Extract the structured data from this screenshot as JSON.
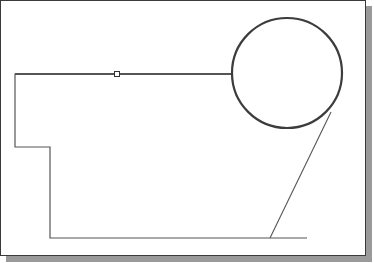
{
  "canvas": {
    "width": 374,
    "height": 263,
    "background": "#ffffff",
    "frame_border_color": "#3a3a3a",
    "shadow_color": "#9a9a9a"
  },
  "sketch": {
    "stroke_color": "#555555",
    "circle_stroke_color": "#3c3c3c",
    "circle": {
      "cx": 287,
      "cy": 73,
      "r": 55
    },
    "polyline_outline": "232,74 15,74 15,147 50,147 50,238 307,238",
    "tangent_line": {
      "x1": 331,
      "y1": 112,
      "x2": 270,
      "y2": 238
    },
    "grip_point": {
      "x": 117,
      "y": 74,
      "size": 5
    }
  }
}
